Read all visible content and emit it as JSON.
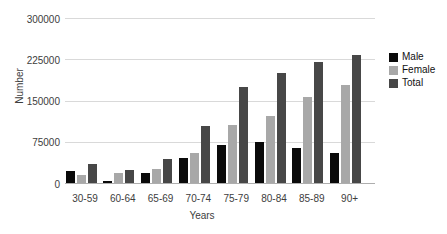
{
  "colors": {
    "male": "#0a0a0a",
    "female": "#a8a8a8",
    "total": "#474747",
    "gridline": "#d9d9d9",
    "axis_line": "#aeaeae",
    "text": "#3d3d3d",
    "background": "#ffffff"
  },
  "chart_data": {
    "type": "bar",
    "title": "",
    "xlabel": "Years",
    "ylabel": "Number",
    "ylim": [
      0,
      300000
    ],
    "yticks": [
      0,
      75000,
      150000,
      225000,
      300000
    ],
    "grid": true,
    "legend_position": "right",
    "categories": [
      "30-59",
      "60-64",
      "65-69",
      "70-74",
      "75-79",
      "80-84",
      "85-89",
      "90+"
    ],
    "series": [
      {
        "name": "Male",
        "color": "#0a0a0a",
        "values": [
          21000,
          4000,
          18000,
          46000,
          69000,
          75000,
          64000,
          54000
        ]
      },
      {
        "name": "Female",
        "color": "#a8a8a8",
        "values": [
          14000,
          18000,
          26000,
          55000,
          105000,
          121000,
          156000,
          178000
        ]
      },
      {
        "name": "Total",
        "color": "#474747",
        "values": [
          35000,
          24000,
          43000,
          103000,
          175000,
          200000,
          220000,
          232000
        ]
      }
    ]
  }
}
